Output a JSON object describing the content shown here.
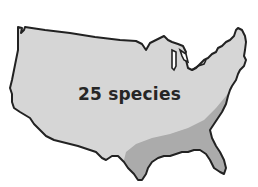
{
  "map": {
    "subject": "United States range map",
    "label": "25 species",
    "colors": {
      "background": "#ffffff",
      "region_main": "#d6d6d6",
      "region_southeast": "#ababab",
      "outline": "#222222",
      "label": "#262626"
    },
    "regions": [
      {
        "name": "contiguous-us",
        "shade": "light"
      },
      {
        "name": "southeast-band",
        "shade": "dark"
      }
    ]
  }
}
